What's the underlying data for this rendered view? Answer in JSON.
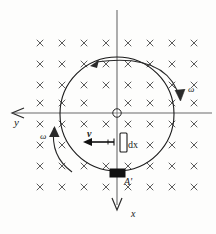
{
  "figure": {
    "colors": {
      "background": "#fdfdfc",
      "axis": "#6b6b6b",
      "circle": "#1a1a1a",
      "cross": "#4a4a4a",
      "rod_fill": "#ffffff",
      "rod_stroke": "#1a1a1a",
      "contact_fill": "#111111",
      "text": "#1a1a1a"
    },
    "labels": {
      "y_axis": "y",
      "x_axis": "x",
      "omega_right": "ω",
      "omega_left": "ω",
      "velocity": "v",
      "element": "dx",
      "contact_point": "A'"
    },
    "geometry": {
      "center_x": 117,
      "center_y": 114,
      "circle_radius": 57,
      "field_symbol": "×",
      "field_direction": "into-page",
      "field_grid_columns": 8,
      "field_grid_rows": 8,
      "field_grid_spacing_x": 22,
      "field_grid_spacing_y": 21,
      "field_grid_origin_x": 40,
      "field_grid_origin_y": 43,
      "x_axis_top": 12,
      "x_axis_bottom": 212,
      "y_axis_left": 12,
      "y_axis_right": 212,
      "rod_x": 120,
      "rod_y": 133,
      "rod_width": 7,
      "rod_height": 19,
      "contact_x": 110,
      "contact_y": 169,
      "contact_width": 15,
      "contact_height": 8,
      "velocity_arrow_from_x": 114,
      "velocity_arrow_to_x": 88,
      "velocity_arrow_y": 142
    }
  }
}
